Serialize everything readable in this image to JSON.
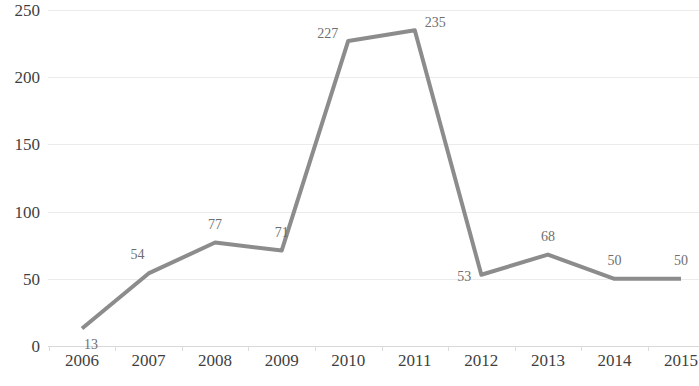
{
  "chart_data": {
    "type": "line",
    "title": "",
    "subtitle": "",
    "xlabel": "",
    "ylabel": "",
    "categories": [
      "2006",
      "2007",
      "2008",
      "2009",
      "2010",
      "2011",
      "2012",
      "2013",
      "2014",
      "2015"
    ],
    "values": [
      13,
      54,
      77,
      71,
      227,
      235,
      53,
      68,
      50,
      50
    ],
    "series": [
      {
        "name": "",
        "values": [
          13,
          54,
          77,
          71,
          227,
          235,
          53,
          68,
          50,
          50
        ]
      }
    ],
    "point_labels": [
      "13",
      "54",
      "77",
      "71",
      "227",
      "235",
      "53",
      "68",
      "50",
      "50"
    ],
    "ylim": [
      0,
      250
    ],
    "yticks": [
      0,
      50,
      100,
      150,
      200,
      250
    ],
    "ytick_labels": [
      "0",
      "50",
      "100",
      "150",
      "200",
      "250"
    ],
    "xtick_labels": [
      "2006",
      "2007",
      "2008",
      "2009",
      "2010",
      "2011",
      "2012",
      "2013",
      "2014",
      "2015"
    ],
    "grid": true,
    "grid_axis": "y",
    "legend": false,
    "legend_position": "none",
    "line_color": "#8c8c8c",
    "grid_color": "#ebebeb",
    "axis_color": "#d9d9d9",
    "label_color": "#6f6f6f",
    "tick_label_color": "#3f3f3f",
    "markers": false,
    "line_width": 4
  }
}
